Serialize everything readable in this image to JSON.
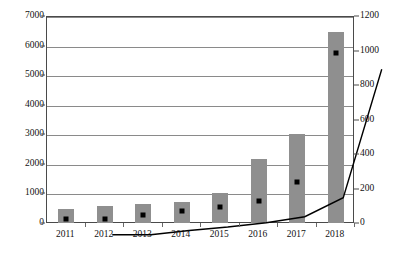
{
  "chart_data": {
    "type": "bar",
    "title": "",
    "subtitle": "",
    "xlabel": "",
    "ylabel": "",
    "categories": [
      "2011",
      "2012",
      "2013",
      "2014",
      "2015",
      "2016",
      "2017",
      "2018"
    ],
    "series": [
      {
        "name": "bars",
        "type": "bar",
        "axis": "left",
        "color": "#8f8f8f",
        "values": [
          520,
          620,
          690,
          760,
          1060,
          2200,
          3060,
          6500
        ]
      },
      {
        "name": "line",
        "type": "line",
        "axis": "right",
        "color": "#000000",
        "marker": "square",
        "values": [
          30,
          30,
          55,
          75,
          100,
          135,
          245,
          990
        ]
      }
    ],
    "left_axis": {
      "min": 0,
      "max": 7000,
      "step": 1000,
      "ticks": [
        "0",
        "1000",
        "2000",
        "3000",
        "4000",
        "5000",
        "6000",
        "7000"
      ]
    },
    "right_axis": {
      "min": 0,
      "max": 1200,
      "step": 200,
      "ticks": [
        "0",
        "200",
        "400",
        "600",
        "800",
        "1000",
        "1200"
      ]
    },
    "grid": true,
    "legend": "none",
    "annotations": []
  }
}
